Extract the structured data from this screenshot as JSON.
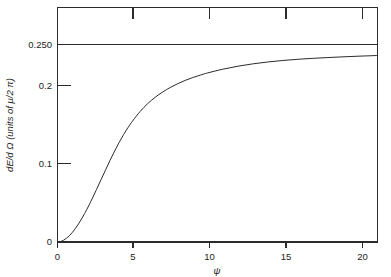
{
  "chart_data": {
    "type": "line",
    "title": "",
    "subtitle": "",
    "xlabel": "ψ",
    "ylabel": "dE/d Ω (units of μ/2 π)",
    "xlim": [
      0,
      21.3
    ],
    "ylim": [
      0,
      0.2975
    ],
    "grid": false,
    "legend": "none",
    "xticks": [
      0,
      5,
      10,
      15,
      20
    ],
    "xticklabels": [
      "0",
      "5",
      "10",
      "15",
      "20"
    ],
    "yticks": [
      0,
      0.1,
      0.2,
      0.25
    ],
    "yticklabels": [
      "0",
      "0.1",
      "0.2",
      "0.250"
    ],
    "annotations": [
      {
        "name": "asymptote",
        "kind": "horizontal-line",
        "y": 0.25,
        "label": "0.250"
      }
    ],
    "series": [
      {
        "name": "dE/dOmega",
        "x": [
          0.0,
          0.2,
          0.4,
          0.6,
          0.8,
          1.0,
          1.2,
          1.4,
          1.6,
          1.8,
          2.0,
          2.3,
          2.6,
          2.9,
          3.2,
          3.5,
          3.8,
          4.1,
          4.4,
          4.7,
          5.0,
          5.5,
          6.0,
          6.5,
          7.0,
          7.5,
          8.0,
          8.5,
          9.0,
          9.5,
          10.0,
          11.0,
          12.0,
          13.0,
          14.0,
          15.0,
          16.0,
          17.0,
          18.0,
          19.0,
          20.0,
          21.0,
          21.3
        ],
        "y": [
          0.0,
          0.0006,
          0.0022,
          0.0048,
          0.0082,
          0.0124,
          0.0174,
          0.023,
          0.0292,
          0.0359,
          0.0431,
          0.0546,
          0.0667,
          0.0791,
          0.0915,
          0.1037,
          0.1153,
          0.1262,
          0.1363,
          0.1454,
          0.1536,
          0.1656,
          0.1755,
          0.1836,
          0.1903,
          0.196,
          0.2008,
          0.205,
          0.2086,
          0.2117,
          0.2145,
          0.2192,
          0.223,
          0.226,
          0.2284,
          0.2303,
          0.2318,
          0.233,
          0.234,
          0.2349,
          0.2357,
          0.2364,
          0.2366
        ]
      }
    ]
  },
  "axes": {
    "y_axis_title": "dE/d Ω (units of μ/2 π)",
    "x_axis_title": "ψ"
  }
}
